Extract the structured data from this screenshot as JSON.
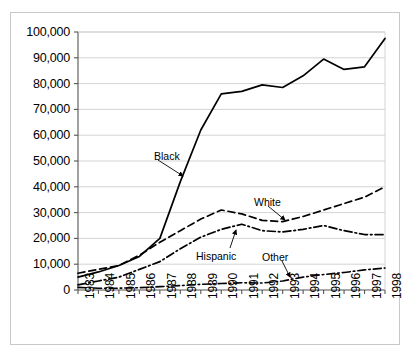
{
  "chart_data": {
    "type": "line",
    "title": "",
    "subtitle": "",
    "xlabel": "",
    "ylabel": "",
    "grid": "horizontal",
    "legend_position": "inline-annotations",
    "xlim": [
      1983,
      1998
    ],
    "ylim": [
      0,
      100000
    ],
    "ytick_step": 10000,
    "categories": [
      "1983",
      "1984",
      "1985",
      "1986",
      "1987",
      "1988",
      "1989",
      "1990",
      "1991",
      "1992",
      "1993",
      "1994",
      "1995",
      "1996",
      "1997",
      "1998"
    ],
    "x": [
      1983,
      1984,
      1985,
      1986,
      1987,
      1988,
      1989,
      1990,
      1991,
      1992,
      1993,
      1994,
      1995,
      1996,
      1997,
      1998
    ],
    "ytick_labels": [
      "0",
      "10,000",
      "20,000",
      "30,000",
      "40,000",
      "50,000",
      "60,000",
      "70,000",
      "80,000",
      "90,000",
      "100,000"
    ],
    "ytick_values": [
      0,
      10000,
      20000,
      30000,
      40000,
      50000,
      60000,
      70000,
      80000,
      90000,
      100000
    ],
    "series": [
      {
        "name": "Black",
        "line_style": "solid",
        "color": "#000000",
        "values": [
          5000,
          7000,
          9500,
          13000,
          20000,
          42000,
          62000,
          76000,
          77000,
          79500,
          78500,
          83000,
          89500,
          85500,
          86500,
          97500
        ]
      },
      {
        "name": "White",
        "line_style": "dashed",
        "color": "#000000",
        "values": [
          6500,
          8000,
          9500,
          13500,
          18500,
          23000,
          27500,
          31000,
          29500,
          27000,
          26500,
          28500,
          31000,
          33500,
          36000,
          40000
        ]
      },
      {
        "name": "Hispanic",
        "line_style": "dash-dot",
        "color": "#000000",
        "values": [
          2000,
          3500,
          5000,
          8000,
          11000,
          16000,
          20500,
          23500,
          25500,
          23000,
          22500,
          23500,
          25000,
          23000,
          21500,
          21500
        ]
      },
      {
        "name": "Other",
        "line_style": "dash-dot",
        "color": "#000000",
        "values": [
          1000,
          700,
          700,
          900,
          1300,
          1700,
          2200,
          2500,
          2800,
          2700,
          3500,
          5000,
          6000,
          6800,
          7800,
          8500
        ]
      }
    ],
    "annotations": [
      {
        "label": "Black",
        "series": "Black",
        "text_x": 154,
        "text_y": 150,
        "arrow_from_x": 158,
        "arrow_from_y": 160,
        "arrow_to_x": 183,
        "arrow_to_y": 176
      },
      {
        "label": "White",
        "series": "White",
        "text_x": 254,
        "text_y": 196,
        "arrow_from_x": 268,
        "arrow_from_y": 206,
        "arrow_to_x": 285,
        "arrow_to_y": 220
      },
      {
        "label": "Hispanic",
        "series": "Hispanic",
        "text_x": 196,
        "text_y": 250,
        "arrow_from_x": 230,
        "arrow_from_y": 248,
        "arrow_to_x": 236,
        "arrow_to_y": 230
      },
      {
        "label": "Other",
        "series": "Other",
        "text_x": 262,
        "text_y": 251,
        "arrow_from_x": 282,
        "arrow_from_y": 261,
        "arrow_to_x": 290,
        "arrow_to_y": 277
      }
    ]
  },
  "colors": {
    "axis": "#555555",
    "grid": "#cfcfcf",
    "ink": "#000000",
    "frame": "#c9c9c9",
    "background": "#ffffff"
  }
}
